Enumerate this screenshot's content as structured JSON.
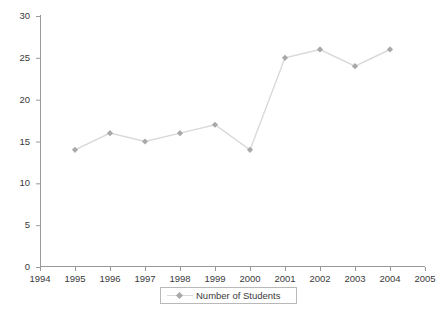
{
  "chart_data": {
    "type": "line",
    "title": "",
    "subtitle": "",
    "xlabel": "",
    "ylabel": "",
    "x": [
      1995,
      1996,
      1997,
      1998,
      1999,
      2000,
      2001,
      2002,
      2003,
      2004
    ],
    "categories": [
      "1995",
      "1996",
      "1997",
      "1998",
      "1999",
      "2000",
      "2001",
      "2002",
      "2003",
      "2004"
    ],
    "series": [
      {
        "name": "Number of Students",
        "values": [
          14,
          16,
          15,
          16,
          17,
          14,
          25,
          26,
          24,
          26
        ],
        "line_color": "#d9d9d9",
        "marker_color": "#a9a9a9",
        "marker": "diamond"
      }
    ],
    "xlim": [
      1994,
      2005
    ],
    "ylim": [
      0,
      30
    ],
    "x_ticks": [
      "1994",
      "1995",
      "1996",
      "1997",
      "1998",
      "1999",
      "2000",
      "2001",
      "2002",
      "2003",
      "2004",
      "2005"
    ],
    "y_ticks": [
      "0",
      "5",
      "10",
      "15",
      "20",
      "25",
      "30"
    ],
    "grid": false,
    "legend_position": "bottom",
    "legend_entries": [
      "Number of Students"
    ],
    "axis_color": "#999999",
    "text_color": "#3a3a3a",
    "background": "#ffffff"
  },
  "legend": {
    "series_label": "Number of Students"
  }
}
